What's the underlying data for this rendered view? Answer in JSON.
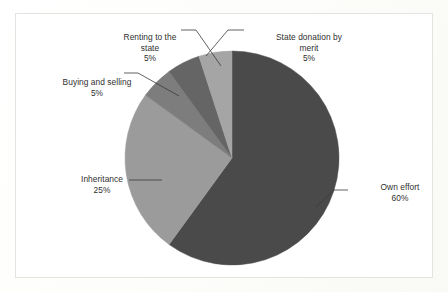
{
  "chart_data": {
    "type": "pie",
    "title": "",
    "subtitle": "",
    "xlabel": "",
    "ylabel": "",
    "legend_position": "none",
    "grid": false,
    "data_label_format": "name + percent",
    "start_angle_deg": 0,
    "direction": "clockwise",
    "categories": [
      "Own effort",
      "Inheritance",
      "Buying and selling",
      "Renting to the state",
      "State donation by merit"
    ],
    "values": [
      60,
      25,
      5,
      5,
      5
    ],
    "slices": [
      {
        "label": "Own effort",
        "value": 60,
        "value_text": "60%",
        "color": "#4a4a4a",
        "start_deg": 0,
        "end_deg": 216
      },
      {
        "label": "Inheritance",
        "value": 25,
        "value_text": "25%",
        "color": "#9b9b9b",
        "start_deg": 216,
        "end_deg": 306
      },
      {
        "label": "Buying and selling",
        "value": 5,
        "value_text": "5%",
        "color": "#7d7d7d",
        "start_deg": 306,
        "end_deg": 324
      },
      {
        "label": "Renting to the state",
        "value": 5,
        "value_text": "5%",
        "color": "#656565",
        "start_deg": 324,
        "end_deg": 342
      },
      {
        "label": "State donation by merit",
        "value": 5,
        "value_text": "5%",
        "color": "#a5a5a5",
        "start_deg": 342,
        "end_deg": 360
      }
    ]
  },
  "labels": {
    "own_effort": {
      "name": "Own effort",
      "value": "60%"
    },
    "inheritance": {
      "name": "Inheritance",
      "value": "25%"
    },
    "buying_and_selling": {
      "name": "Buying and selling",
      "value": "5%"
    },
    "renting_to_the_state": {
      "name": "Renting to the",
      "name2": "state",
      "value": "5%"
    },
    "state_donation_by_merit": {
      "name": "State donation by",
      "name2": "merit",
      "value": "5%"
    }
  },
  "style": {
    "frame_border_color": "#e3e3df",
    "page_background": "#fefefc",
    "text_color": "#2f2f2f",
    "leader_line_color": "#3a3a3a"
  }
}
